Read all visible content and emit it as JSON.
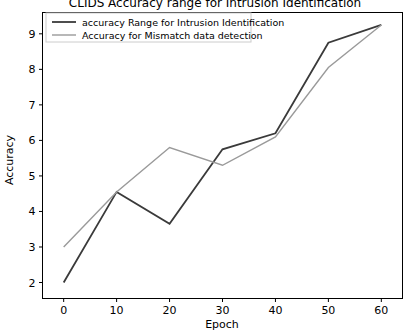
{
  "chart_data": {
    "type": "line",
    "title": "CLIDS Accuracy range for Intrusion Identification",
    "xlabel": "Epoch",
    "ylabel": "Accuracy",
    "x": [
      0,
      10,
      20,
      30,
      40,
      50,
      60
    ],
    "xlim": [
      -4,
      64
    ],
    "ylim": [
      1.55,
      9.6
    ],
    "xticks": [
      0,
      10,
      20,
      30,
      40,
      50,
      60
    ],
    "xtick_labels": [
      "0",
      "10",
      "20",
      "30",
      "40",
      "50",
      "60"
    ],
    "yticks": [
      2,
      3,
      4,
      5,
      6,
      7,
      8,
      9
    ],
    "ytick_labels": [
      "2",
      "3",
      "4",
      "5",
      "6",
      "7",
      "8",
      "9"
    ],
    "grid": false,
    "legend_position": "upper left",
    "series": [
      {
        "name": "accuracy Range for Intrusion Identification",
        "color": "#3a3a3a",
        "width": 1.8,
        "values": [
          2.0,
          4.55,
          3.65,
          5.75,
          6.2,
          8.75,
          9.25
        ]
      },
      {
        "name": "Accuracy for Mismatch data detection",
        "color": "#9a9a9a",
        "width": 1.4,
        "values": [
          3.0,
          4.55,
          5.8,
          5.3,
          6.1,
          8.05,
          9.25
        ]
      }
    ]
  },
  "figure": {
    "background_color": "#ffffff",
    "axes_color": "#000000"
  }
}
